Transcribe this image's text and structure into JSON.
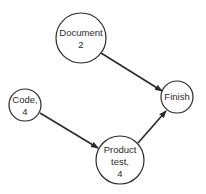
{
  "diagram": {
    "type": "activity-network",
    "nodes": [
      {
        "id": "document",
        "lines": [
          "Document",
          "2"
        ],
        "cx": 81,
        "cy": 38,
        "r": 25
      },
      {
        "id": "code",
        "lines": [
          "Code,",
          "4"
        ],
        "cx": 25,
        "cy": 105,
        "r": 16
      },
      {
        "id": "finish",
        "lines": [
          "Finish"
        ],
        "cx": 177,
        "cy": 97,
        "r": 16
      },
      {
        "id": "product-test",
        "lines": [
          "Product",
          "test,",
          "4"
        ],
        "cx": 120,
        "cy": 160,
        "r": 24
      }
    ],
    "edges": [
      {
        "from": "document",
        "to": "finish"
      },
      {
        "from": "code",
        "to": "product-test"
      },
      {
        "from": "product-test",
        "to": "finish"
      }
    ],
    "colors": {
      "stroke": "#2a2a2a",
      "background": "#ffffff"
    }
  }
}
